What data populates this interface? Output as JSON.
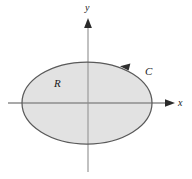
{
  "figure": {
    "type": "diagram",
    "background_color": "#ffffff"
  },
  "axes": {
    "x_axis": {
      "label": "x",
      "icon": "arrow-right-icon",
      "start_x": 8,
      "end_x": 174,
      "y": 103,
      "color": "#808080"
    },
    "y_axis": {
      "label": "y",
      "icon": "arrow-up-icon",
      "x": 88,
      "start_y": 172,
      "end_y": 22,
      "color": "#9a9a9a"
    }
  },
  "region": {
    "label": "R",
    "label_x": 58,
    "label_y": 83,
    "fill_color": "#e2e2e2",
    "stroke_color": "#5a5a5a",
    "shape": "ellipse",
    "center_x": 87,
    "center_y": 103,
    "radius_x": 65,
    "radius_y": 41
  },
  "curve": {
    "label": "C",
    "label_x": 148,
    "label_y": 72,
    "orientation": "counterclockwise",
    "icon": "arrowhead-icon",
    "arrow_x": 126,
    "arrow_y": 65,
    "stroke_color": "#5a5a5a",
    "arrow_color": "#333333"
  }
}
